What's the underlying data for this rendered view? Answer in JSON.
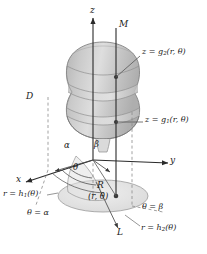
{
  "figure": {
    "background_color": "#ffffff",
    "ink_color": "#1a1a1a",
    "solid_fill": "#c9c9c9",
    "solid_fill_light": "#dcdcdc",
    "base_fill": "#e6e6e6",
    "width": 207,
    "height": 254
  },
  "axes": {
    "z_label": "z",
    "x_label": "x",
    "y_label": "y"
  },
  "solid": {
    "region_label": "D",
    "top_point_label": "M",
    "bottom_curve_label": "L"
  },
  "surfaces": {
    "top_equals": "z = g",
    "top_sub": "2",
    "top_args": "(r, θ)",
    "top_full": "z = g₂(r, θ)",
    "bottom_equals": "z = g",
    "bottom_sub": "1",
    "bottom_args": "(r, θ)",
    "bottom_full": "z = g₁(r, θ)"
  },
  "base_region": {
    "label": "R",
    "point_label": "(r, θ)",
    "angle_label": "θ",
    "alpha_label": "α",
    "beta_label": "β",
    "theta_alpha": "θ = α",
    "theta_beta": "θ = β",
    "r_inner_equals": "r = h",
    "r_inner_sub": "1",
    "r_inner_args": "(θ)",
    "r_inner_full": "r = h₁(θ)",
    "r_outer_equals": "r = h",
    "r_outer_sub": "2",
    "r_outer_args": "(θ)",
    "r_outer_full": "r = h₂(θ)"
  }
}
